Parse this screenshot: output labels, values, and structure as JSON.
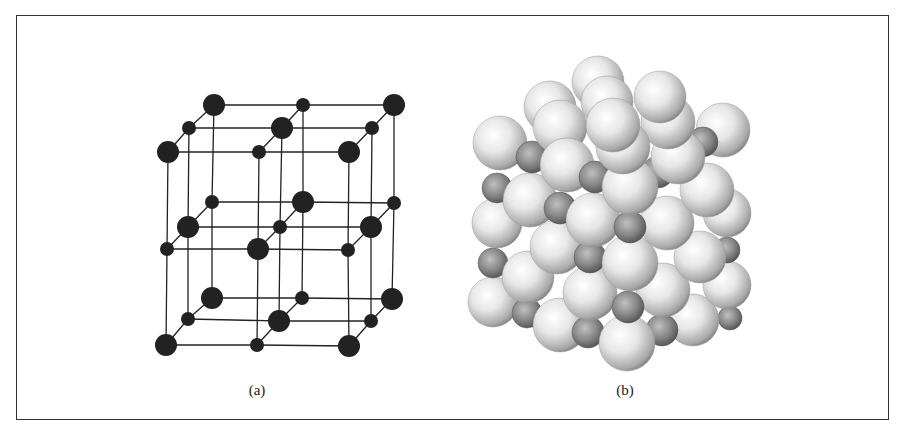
{
  "figure": {
    "panels": [
      {
        "id": "a",
        "label": "(a)",
        "label_x": 257,
        "description": "Ball-and-stick lattice model (rock-salt type cubic structure)",
        "node_color": "#222222",
        "line_color": "#222222",
        "large_radius": 11,
        "small_radius": 7,
        "large_nodes": [
          [
            214,
            105
          ],
          [
            394,
            105
          ],
          [
            282,
            128
          ],
          [
            168,
            152
          ],
          [
            349,
            152
          ],
          [
            303,
            202
          ],
          [
            188,
            227
          ],
          [
            371,
            227
          ],
          [
            258,
            249
          ],
          [
            212,
            298
          ],
          [
            392,
            299
          ],
          [
            279,
            321
          ],
          [
            166,
            345
          ],
          [
            349,
            346
          ]
        ],
        "small_nodes": [
          [
            303,
            105
          ],
          [
            189,
            128
          ],
          [
            372,
            128
          ],
          [
            259,
            152
          ],
          [
            212,
            202
          ],
          [
            394,
            203
          ],
          [
            280,
            227
          ],
          [
            167,
            249
          ],
          [
            348,
            250
          ],
          [
            302,
            298
          ],
          [
            188,
            319
          ],
          [
            371,
            321
          ],
          [
            257,
            345
          ]
        ]
      },
      {
        "id": "b",
        "label": "(b)",
        "label_x": 625,
        "description": "Space-filling model of the same cubic structure",
        "large_sphere_color": "#e8e8e8",
        "small_sphere_color": "#8a8a8a",
        "large_spheres": [
          [
            598,
            82,
            26
          ],
          [
            550,
            107,
            26
          ],
          [
            607,
            102,
            26
          ],
          [
            660,
            97,
            26
          ],
          [
            560,
            127,
            27
          ],
          [
            613,
            125,
            27
          ],
          [
            668,
            122,
            27
          ],
          [
            500,
            143,
            27
          ],
          [
            723,
            130,
            27
          ],
          [
            567,
            165,
            27
          ],
          [
            623,
            147,
            27
          ],
          [
            678,
            157,
            27
          ],
          [
            530,
            200,
            27
          ],
          [
            497,
            223,
            25
          ],
          [
            593,
            220,
            27
          ],
          [
            667,
            223,
            27
          ],
          [
            707,
            190,
            27
          ],
          [
            727,
            213,
            24
          ],
          [
            557,
            247,
            27
          ],
          [
            630,
            187,
            28
          ],
          [
            700,
            257,
            26
          ],
          [
            528,
            277,
            26
          ],
          [
            493,
            302,
            25
          ],
          [
            590,
            293,
            27
          ],
          [
            663,
            290,
            27
          ],
          [
            727,
            285,
            24
          ],
          [
            630,
            263,
            28
          ],
          [
            560,
            325,
            27
          ],
          [
            693,
            320,
            26
          ],
          [
            627,
            343,
            28
          ]
        ],
        "small_spheres": [
          [
            532,
            157,
            16
          ],
          [
            703,
            142,
            15
          ],
          [
            595,
            177,
            16
          ],
          [
            658,
            172,
            16
          ],
          [
            497,
            188,
            15
          ],
          [
            560,
            208,
            16
          ],
          [
            630,
            227,
            16
          ],
          [
            493,
            263,
            15
          ],
          [
            590,
            257,
            16
          ],
          [
            727,
            250,
            13
          ],
          [
            527,
            313,
            15
          ],
          [
            628,
            307,
            16
          ],
          [
            588,
            332,
            16
          ],
          [
            662,
            330,
            16
          ],
          [
            730,
            318,
            12
          ]
        ]
      }
    ]
  }
}
